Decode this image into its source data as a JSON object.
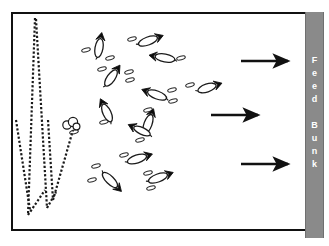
{
  "diagram": {
    "background_color": "#ffffff",
    "frame": {
      "border_color": "#111111",
      "fill_color": "#ffffff",
      "x": 11,
      "y": 12,
      "width": 296,
      "height": 219
    }
  },
  "feed_bunk": {
    "label": "Feed Bunk",
    "letters": [
      "F",
      "e",
      "e",
      "d",
      "",
      "B",
      "u",
      "n",
      "k"
    ],
    "color": "#8a8a8a",
    "text_color": "#ffffff",
    "orientation": "vertical",
    "x": 305,
    "y": 12,
    "width": 19,
    "height": 226
  },
  "arrows": {
    "color": "#111111",
    "direction": "right",
    "count": 3,
    "items": [
      {
        "name": "arrow-top",
        "x1": 241,
        "y1": 61,
        "x2": 291,
        "y2": 61
      },
      {
        "name": "arrow-middle",
        "x1": 211,
        "y1": 115,
        "x2": 261,
        "y2": 115
      },
      {
        "name": "arrow-bottom",
        "x1": 241,
        "y1": 164,
        "x2": 291,
        "y2": 164
      }
    ]
  },
  "paths": {
    "style": "dotted",
    "color": "#1a1a1a",
    "description": "Dotted cow travel paths forming zigzag lines on the left side of the pen",
    "polylines": [
      [
        [
          16,
          120
        ],
        [
          30,
          210
        ]
      ],
      [
        [
          35,
          18
        ],
        [
          28,
          215
        ]
      ],
      [
        [
          28,
          215
        ],
        [
          45,
          190
        ]
      ],
      [
        [
          36,
          19
        ],
        [
          47,
          208
        ]
      ],
      [
        [
          47,
          208
        ],
        [
          56,
          192
        ]
      ],
      [
        [
          48,
          120
        ],
        [
          53,
          200
        ]
      ],
      [
        [
          53,
          200
        ],
        [
          73,
          130
        ]
      ]
    ]
  },
  "cattle": {
    "body_outline_color": "#1a1a1a",
    "head_color": "#0d0d0d",
    "count": 17,
    "items": [
      {
        "name": "cow-1",
        "cx": 99,
        "cy": 48,
        "angle": -80,
        "len": 19,
        "wid": 8
      },
      {
        "name": "cow-2",
        "cx": 148,
        "cy": 41,
        "angle": -20,
        "len": 20,
        "wid": 8
      },
      {
        "name": "cow-3",
        "cx": 165,
        "cy": 58,
        "angle": 190,
        "len": 20,
        "wid": 8
      },
      {
        "name": "cow-4",
        "cx": 111,
        "cy": 78,
        "angle": -55,
        "len": 19,
        "wid": 8
      },
      {
        "name": "cow-5",
        "cx": 157,
        "cy": 95,
        "angle": 200,
        "len": 20,
        "wid": 8
      },
      {
        "name": "cow-6",
        "cx": 207,
        "cy": 88,
        "angle": -18,
        "len": 19,
        "wid": 8
      },
      {
        "name": "cow-7",
        "cx": 107,
        "cy": 113,
        "angle": -115,
        "len": 19,
        "wid": 8
      },
      {
        "name": "cow-8",
        "cx": 148,
        "cy": 124,
        "angle": -70,
        "len": 20,
        "wid": 8
      },
      {
        "name": "cow-9",
        "cx": 142,
        "cy": 131,
        "angle": 205,
        "len": 18,
        "wid": 7
      },
      {
        "name": "cow-10",
        "cx": 137,
        "cy": 159,
        "angle": -18,
        "len": 20,
        "wid": 8
      },
      {
        "name": "cow-11",
        "cx": 110,
        "cy": 180,
        "angle": 45,
        "len": 20,
        "wid": 8
      },
      {
        "name": "cow-12",
        "cx": 158,
        "cy": 178,
        "angle": -20,
        "len": 20,
        "wid": 8
      },
      {
        "name": "cow-13",
        "cx": 70,
        "cy": 124,
        "angle": 0,
        "len": 10,
        "wid": 10,
        "view": "front"
      }
    ]
  },
  "markers": {
    "description": "Small ear/tag ellipse marks scattered near the cattle",
    "color": "#2a2a2a",
    "items": [
      {
        "cx": 86,
        "cy": 50,
        "r": 3,
        "angle": -15
      },
      {
        "cx": 110,
        "cy": 58,
        "r": 3,
        "angle": -15
      },
      {
        "cx": 132,
        "cy": 39,
        "r": 3,
        "angle": -15
      },
      {
        "cx": 181,
        "cy": 58,
        "r": 3,
        "angle": -15
      },
      {
        "cx": 102,
        "cy": 69,
        "r": 3,
        "angle": -15
      },
      {
        "cx": 129,
        "cy": 72,
        "r": 3,
        "angle": -15
      },
      {
        "cx": 130,
        "cy": 80,
        "r": 3,
        "angle": -15
      },
      {
        "cx": 148,
        "cy": 110,
        "r": 3,
        "angle": -15
      },
      {
        "cx": 172,
        "cy": 90,
        "r": 3,
        "angle": -15
      },
      {
        "cx": 173,
        "cy": 101,
        "r": 3,
        "angle": -15
      },
      {
        "cx": 190,
        "cy": 85,
        "r": 3,
        "angle": -15
      },
      {
        "cx": 104,
        "cy": 122,
        "r": 3,
        "angle": -15
      },
      {
        "cx": 140,
        "cy": 140,
        "r": 3,
        "angle": -15
      },
      {
        "cx": 124,
        "cy": 155,
        "r": 3,
        "angle": -15
      },
      {
        "cx": 96,
        "cy": 166,
        "r": 3,
        "angle": -15
      },
      {
        "cx": 92,
        "cy": 180,
        "r": 3,
        "angle": -15
      },
      {
        "cx": 148,
        "cy": 173,
        "r": 3,
        "angle": -15
      },
      {
        "cx": 151,
        "cy": 188,
        "r": 3,
        "angle": -15
      },
      {
        "cx": 74,
        "cy": 132,
        "r": 3,
        "angle": -15
      }
    ]
  }
}
